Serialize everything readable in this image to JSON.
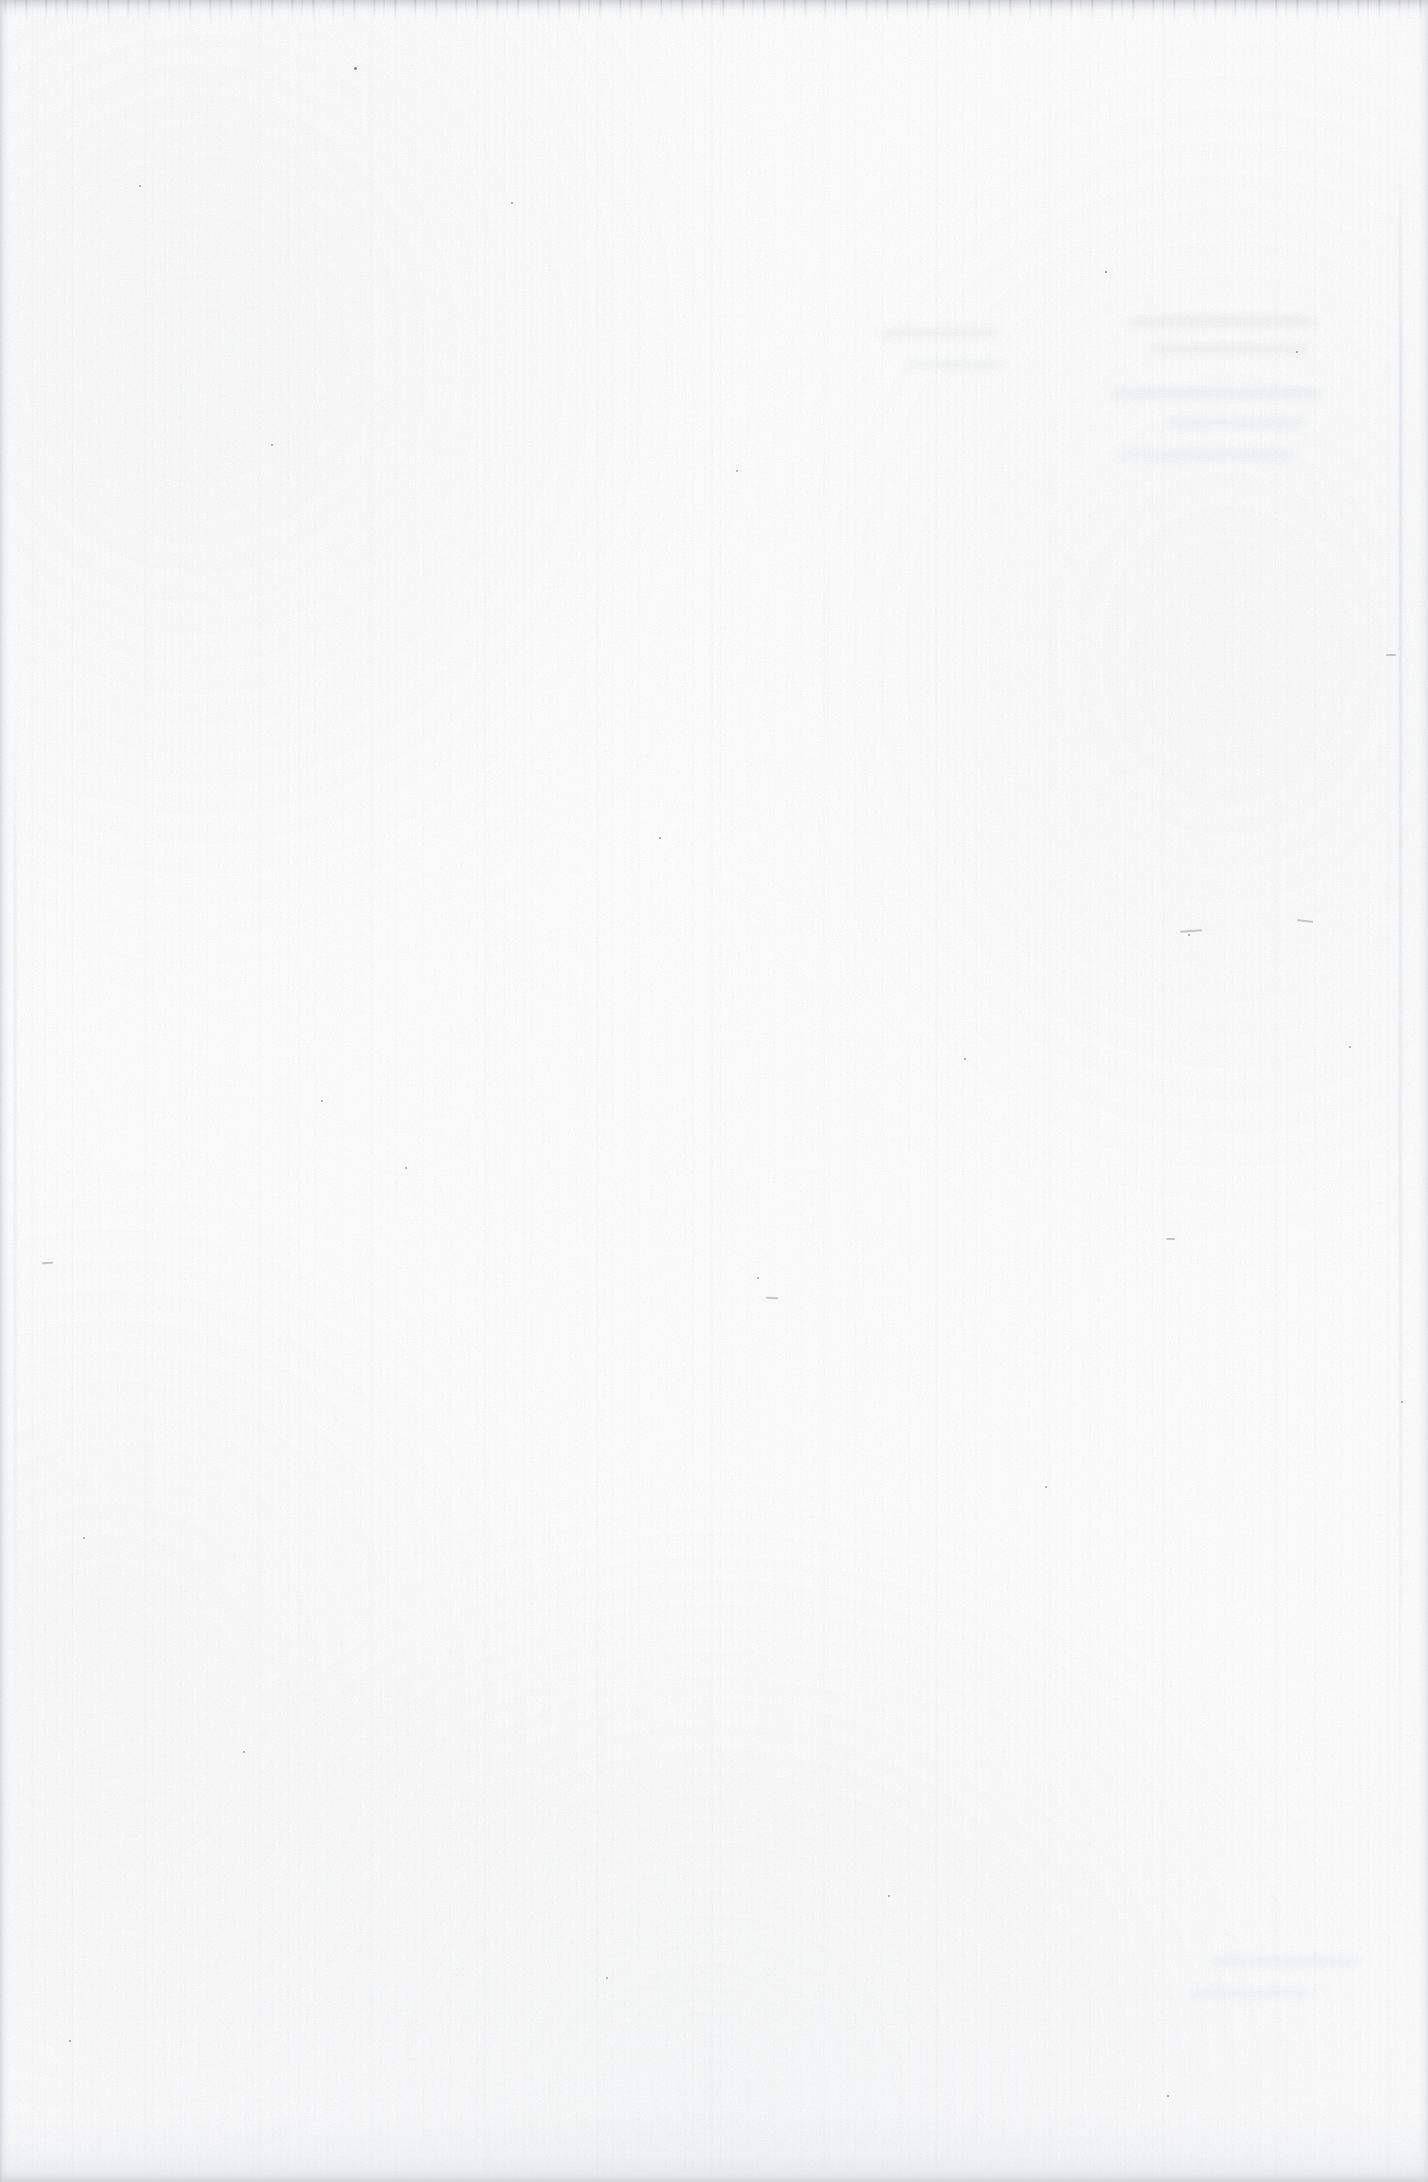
{
  "document": {
    "page_kind": "blank-scanned-page",
    "visible_text": "",
    "page_number": "",
    "heading": "",
    "body_text": "",
    "caption": "",
    "footer_text": "",
    "header_text": ""
  },
  "canvas": {
    "width": 1428,
    "height": 2182,
    "orientation": "portrait"
  },
  "colors": {
    "paper": "#fdfdfd",
    "paper_shade": "#f8f9fa",
    "edge_shadow_bottom": "#d4d7da",
    "edge_shadow_left": "#babfc7",
    "edge_shadow_top": "#989ea7",
    "speck": "#6e7480"
  },
  "artifacts": {
    "top_edge_band": "dark scan lead-in streak",
    "bottom_edge_band": "light grey platen shadow",
    "left_edge_band": "grey page-edge shadow",
    "right_edge_band": "grey page-edge shadow",
    "streaking": "fine vertical scanner streaks",
    "grain": "paper speckle noise",
    "show_through": "faint illegible ghosting, upper-right quadrant"
  },
  "specks": [
    {
      "x": 355,
      "y": 68,
      "d": 3.0
    },
    {
      "x": 1106,
      "y": 272,
      "d": 2.6
    },
    {
      "x": 660,
      "y": 838,
      "d": 2.4
    },
    {
      "x": 965,
      "y": 1059,
      "d": 2.2
    },
    {
      "x": 140,
      "y": 186,
      "d": 1.8
    },
    {
      "x": 512,
      "y": 203,
      "d": 1.6
    },
    {
      "x": 1297,
      "y": 352,
      "d": 1.7
    },
    {
      "x": 272,
      "y": 445,
      "d": 1.5
    },
    {
      "x": 737,
      "y": 471,
      "d": 1.5
    },
    {
      "x": 1189,
      "y": 935,
      "d": 1.6
    },
    {
      "x": 322,
      "y": 1101,
      "d": 1.8
    },
    {
      "x": 406,
      "y": 1168,
      "d": 2.0
    },
    {
      "x": 84,
      "y": 1538,
      "d": 1.6
    },
    {
      "x": 1350,
      "y": 1047,
      "d": 1.5
    },
    {
      "x": 758,
      "y": 1278,
      "d": 1.4
    },
    {
      "x": 1046,
      "y": 1487,
      "d": 1.5
    },
    {
      "x": 244,
      "y": 1752,
      "d": 1.6
    },
    {
      "x": 889,
      "y": 1896,
      "d": 1.5
    },
    {
      "x": 70,
      "y": 2041,
      "d": 1.7
    },
    {
      "x": 1168,
      "y": 2096,
      "d": 1.8
    },
    {
      "x": 607,
      "y": 1978,
      "d": 1.4
    },
    {
      "x": 1402,
      "y": 1402,
      "d": 1.5
    }
  ],
  "fibers": [
    {
      "x": 1180,
      "y": 930,
      "w": 22,
      "h": 2,
      "r": -4
    },
    {
      "x": 1297,
      "y": 920,
      "w": 16,
      "h": 2,
      "r": 6
    },
    {
      "x": 1386,
      "y": 654,
      "w": 10,
      "h": 2,
      "r": 0
    },
    {
      "x": 1166,
      "y": 1238,
      "w": 9,
      "h": 2,
      "r": 0
    },
    {
      "x": 766,
      "y": 1297,
      "w": 12,
      "h": 2,
      "r": 3
    },
    {
      "x": 42,
      "y": 1262,
      "w": 11,
      "h": 2,
      "r": -2
    }
  ],
  "show_through_blobs": [
    {
      "x": 1128,
      "y": 318,
      "w": 190,
      "h": 7
    },
    {
      "x": 1150,
      "y": 346,
      "w": 160,
      "h": 6
    },
    {
      "x": 1112,
      "y": 390,
      "w": 210,
      "h": 7
    },
    {
      "x": 1168,
      "y": 420,
      "w": 138,
      "h": 6
    },
    {
      "x": 1120,
      "y": 452,
      "w": 176,
      "h": 6
    },
    {
      "x": 880,
      "y": 330,
      "w": 120,
      "h": 6
    },
    {
      "x": 905,
      "y": 362,
      "w": 96,
      "h": 5
    },
    {
      "x": 1210,
      "y": 1958,
      "w": 150,
      "h": 6
    },
    {
      "x": 1190,
      "y": 1990,
      "w": 120,
      "h": 5
    }
  ]
}
